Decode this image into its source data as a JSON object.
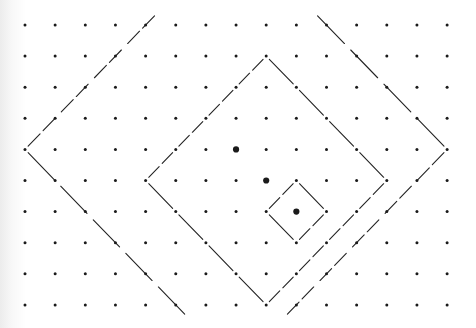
{
  "figure": {
    "grid": {
      "columns": 15,
      "rows": 10
    },
    "colors": {
      "dot": "#1a1a1a",
      "line": "#222222",
      "background": "#ffffff"
    },
    "highlighted_points": [
      {
        "col": 7,
        "row": 4
      },
      {
        "col": 8,
        "row": 5
      },
      {
        "col": 9,
        "row": 6
      }
    ],
    "shapes": [
      {
        "name": "small-diamond",
        "closed": true,
        "vertices": [
          {
            "col": 9,
            "row": 5
          },
          {
            "col": 10,
            "row": 6
          },
          {
            "col": 9,
            "row": 7
          },
          {
            "col": 8,
            "row": 6
          }
        ]
      },
      {
        "name": "middle-diamond",
        "closed": true,
        "vertices": [
          {
            "col": 8,
            "row": 1
          },
          {
            "col": 12,
            "row": 5
          },
          {
            "col": 8,
            "row": 9
          },
          {
            "col": 4,
            "row": 5
          }
        ]
      },
      {
        "name": "outer-left-chevron",
        "closed": false,
        "vertices": [
          {
            "col": 4.4,
            "row": -0.4
          },
          {
            "col": 0,
            "row": 4
          },
          {
            "col": 5.4,
            "row": 9.4
          }
        ]
      },
      {
        "name": "outer-right-chevron",
        "closed": false,
        "vertices": [
          {
            "col": 9.6,
            "row": -0.4
          },
          {
            "col": 14,
            "row": 4
          },
          {
            "col": 8.6,
            "row": 9.4
          }
        ]
      }
    ]
  }
}
